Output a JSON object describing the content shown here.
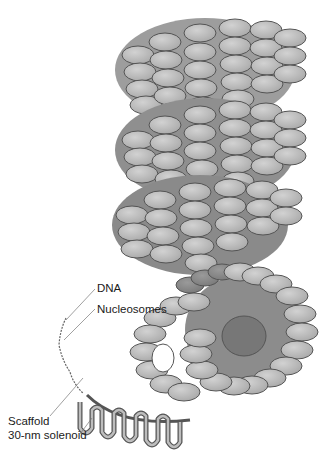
{
  "diagram": {
    "labels": {
      "dna": "DNA",
      "nucleosomes": "Nucleosomes",
      "scaffold": "Scaffold",
      "solenoid": "30-nm solenoid"
    },
    "colors": {
      "nucleosome_fill": "#b8b8b8",
      "nucleosome_light": "#c8c8c8",
      "nucleosome_dark": "#8a8a8a",
      "outline": "#555555",
      "background": "#ffffff",
      "text": "#1a1a1a"
    }
  }
}
